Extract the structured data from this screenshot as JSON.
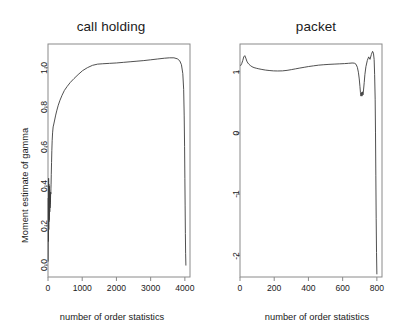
{
  "figure": {
    "background": "#ffffff",
    "line_color": "#3c3c3c",
    "axis_color": "#8a8a8a"
  },
  "panels": [
    {
      "id": "call-holding",
      "title": "call holding",
      "xlabel": "number of order statistics",
      "ylabel": "Moment estimate of gamma",
      "xticks": [
        "0",
        "1000",
        "2000",
        "3000",
        "4000"
      ],
      "yticks": [
        "0.0",
        "0.2",
        "0.4",
        "0.6",
        "0.8",
        "1.0"
      ]
    },
    {
      "id": "packet",
      "title": "packet",
      "xlabel": "number of order statistics",
      "ylabel": "Moment estimate of gamma",
      "xticks": [
        "0",
        "200",
        "400",
        "600",
        "800"
      ],
      "yticks": [
        "1",
        "0",
        "-1",
        "-2"
      ]
    }
  ],
  "chart_data": [
    {
      "type": "line",
      "title": "call holding",
      "xlabel": "number of order statistics",
      "ylabel": "Moment estimate of gamma",
      "xlim": [
        0,
        4150
      ],
      "ylim": [
        -0.06,
        1.12
      ],
      "xticks": [
        0,
        1000,
        2000,
        3000,
        4000
      ],
      "yticks": [
        0.0,
        0.2,
        0.4,
        0.6,
        0.8,
        1.0
      ],
      "grid": false,
      "legend": null,
      "series": [
        {
          "name": "moment estimate",
          "x": [
            5,
            10,
            14,
            18,
            22,
            25,
            28,
            30,
            32,
            34,
            36,
            38,
            40,
            42,
            44,
            46,
            48,
            50,
            52,
            54,
            56,
            58,
            60,
            62,
            64,
            66,
            68,
            70,
            74,
            78,
            82,
            86,
            90,
            96,
            104,
            112,
            122,
            134,
            150,
            170,
            195,
            225,
            260,
            300,
            350,
            410,
            480,
            560,
            650,
            760,
            880,
            1010,
            1150,
            1300,
            1450,
            1600,
            1800,
            2000,
            2200,
            2400,
            2600,
            2800,
            3000,
            3200,
            3400,
            3550,
            3680,
            3780,
            3850,
            3900,
            3940,
            3965,
            3980,
            3992,
            4000,
            4008,
            4015,
            4022,
            4030
          ],
          "y": [
            0.02,
            0.34,
            0.12,
            0.44,
            0.18,
            0.41,
            0.22,
            0.39,
            0.26,
            0.36,
            0.23,
            0.4,
            0.28,
            0.33,
            0.25,
            0.38,
            0.3,
            0.34,
            0.27,
            0.36,
            0.31,
            0.35,
            0.29,
            0.37,
            0.32,
            0.35,
            0.33,
            0.36,
            0.34,
            0.37,
            0.36,
            0.39,
            0.41,
            0.46,
            0.52,
            0.58,
            0.63,
            0.67,
            0.7,
            0.715,
            0.735,
            0.76,
            0.785,
            0.81,
            0.835,
            0.86,
            0.885,
            0.905,
            0.925,
            0.945,
            0.965,
            0.985,
            1.0,
            1.012,
            1.018,
            1.02,
            1.022,
            1.024,
            1.027,
            1.03,
            1.033,
            1.036,
            1.04,
            1.044,
            1.048,
            1.05,
            1.05,
            1.045,
            1.035,
            1.015,
            0.97,
            0.89,
            0.76,
            0.6,
            0.44,
            0.3,
            0.16,
            0.06,
            0.0
          ]
        }
      ]
    },
    {
      "type": "line",
      "title": "packet",
      "xlabel": "number of order statistics",
      "ylabel": "Moment estimate of gamma",
      "xlim": [
        0,
        830
      ],
      "ylim": [
        -2.35,
        1.45
      ],
      "xticks": [
        0,
        200,
        400,
        600,
        800
      ],
      "yticks": [
        1,
        0,
        -1,
        -2
      ],
      "grid": false,
      "legend": null,
      "series": [
        {
          "name": "moment estimate",
          "x": [
            4,
            10,
            16,
            22,
            28,
            34,
            40,
            46,
            52,
            60,
            70,
            82,
            95,
            110,
            128,
            148,
            170,
            195,
            220,
            248,
            275,
            300,
            325,
            350,
            375,
            400,
            430,
            460,
            490,
            520,
            550,
            580,
            610,
            635,
            655,
            668,
            678,
            686,
            692,
            697,
            701,
            704,
            707,
            710,
            713,
            716,
            719,
            722,
            726,
            730,
            736,
            744,
            752,
            760,
            768,
            775,
            780,
            784,
            787,
            790,
            792,
            794,
            796,
            798,
            800
          ],
          "y": [
            1.1,
            1.13,
            1.18,
            1.24,
            1.26,
            1.22,
            1.17,
            1.14,
            1.12,
            1.1,
            1.08,
            1.065,
            1.055,
            1.045,
            1.035,
            1.025,
            1.018,
            1.012,
            1.01,
            1.012,
            1.02,
            1.032,
            1.045,
            1.058,
            1.07,
            1.082,
            1.094,
            1.105,
            1.112,
            1.118,
            1.122,
            1.126,
            1.13,
            1.135,
            1.14,
            1.138,
            1.12,
            1.07,
            0.99,
            0.88,
            0.76,
            0.66,
            0.6,
            0.66,
            0.6,
            0.67,
            0.62,
            0.7,
            0.82,
            0.95,
            1.08,
            1.18,
            1.24,
            1.2,
            1.28,
            1.33,
            1.3,
            1.2,
            0.95,
            0.55,
            0.0,
            -0.7,
            -1.4,
            -1.95,
            -2.3
          ]
        }
      ]
    }
  ]
}
